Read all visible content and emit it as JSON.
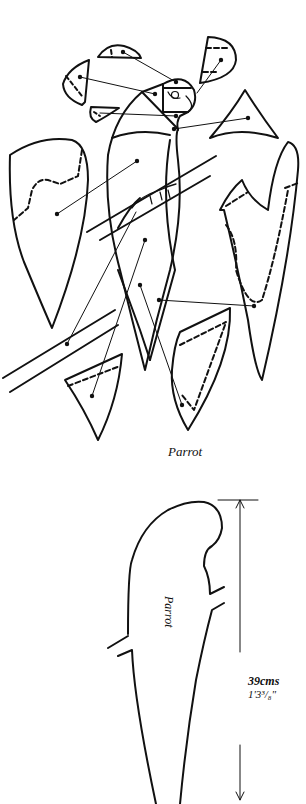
{
  "diagram": {
    "type": "craft-pattern",
    "subject": "Parrot",
    "exploded_view": {
      "caption": "Parrot",
      "pieces": [
        {
          "name": "head-cap-piece"
        },
        {
          "name": "head-side-piece"
        },
        {
          "name": "crest-piece"
        },
        {
          "name": "beak-piece"
        },
        {
          "name": "wing-piece-left"
        },
        {
          "name": "wing-piece-right"
        },
        {
          "name": "chest-piece"
        },
        {
          "name": "tail-piece-left"
        },
        {
          "name": "tail-piece-right"
        },
        {
          "name": "perch-branch"
        }
      ]
    },
    "template": {
      "inner_label": "Parrot",
      "dimension_metric": "39cms",
      "dimension_imperial": "1'3³/₈\""
    },
    "colors": {
      "line": "#111111",
      "background": "#ffffff"
    }
  }
}
